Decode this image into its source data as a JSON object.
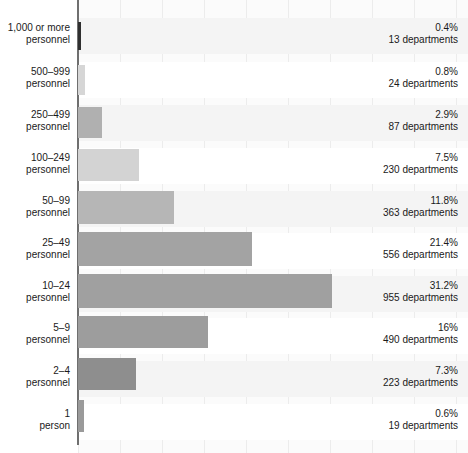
{
  "chart_data": {
    "type": "bar",
    "orientation": "horizontal",
    "title": "",
    "subtitle": "",
    "xlabel": "",
    "ylabel": "",
    "grid": true,
    "legend": "none",
    "xlim": [
      0,
      46.7
    ],
    "value_unit": "percent",
    "count_unit": "departments",
    "categories": [
      "1,000 or more\npersonnel",
      "500–999\npersonnel",
      "250–499\npersonnel",
      "100–249\npersonnel",
      "50–99\npersonnel",
      "25–49\npersonnel",
      "10–24\npersonnel",
      "5–9\npersonnel",
      "2–4\npersonnel",
      "1\nperson"
    ],
    "values": [
      0.4,
      0.8,
      2.9,
      7.5,
      11.8,
      21.4,
      31.2,
      16,
      7.3,
      0.6
    ],
    "counts": [
      13,
      24,
      87,
      230,
      363,
      556,
      955,
      490,
      223,
      19
    ],
    "rows": [
      {
        "category": "1,000 or more\npersonnel",
        "percent_label": "0.4%",
        "count_label": "13 departments",
        "value": 0.4,
        "count": 13,
        "bar_color": "#2f2f2f",
        "bar_width_px": 3,
        "top": 18,
        "height": 36,
        "bar_top": 22,
        "bar_height": 28
      },
      {
        "category": "500–999\npersonnel",
        "percent_label": "0.8%",
        "count_label": "24 departments",
        "value": 0.8,
        "count": 24,
        "bar_color": "#d6d6d6",
        "bar_width_px": 7,
        "top": 62,
        "height": 36,
        "bar_top": 65,
        "bar_height": 30
      },
      {
        "category": "250–499\npersonnel",
        "percent_label": "2.9%",
        "count_label": "87 departments",
        "value": 2.9,
        "count": 87,
        "bar_color": "#b0b0b0",
        "bar_width_px": 24,
        "top": 105,
        "height": 36,
        "bar_top": 107,
        "bar_height": 31
      },
      {
        "category": "100–249\npersonnel",
        "percent_label": "7.5%",
        "count_label": "230 departments",
        "value": 7.5,
        "count": 230,
        "bar_color": "#d3d3d3",
        "bar_width_px": 61,
        "top": 148,
        "height": 36,
        "bar_top": 149,
        "bar_height": 32
      },
      {
        "category": "50–99\npersonnel",
        "percent_label": "11.8%",
        "count_label": "363 departments",
        "value": 11.8,
        "count": 363,
        "bar_color": "#b6b6b6",
        "bar_width_px": 96,
        "top": 191,
        "height": 36,
        "bar_top": 191,
        "bar_height": 33
      },
      {
        "category": "25–49\npersonnel",
        "percent_label": "21.4%",
        "count_label": "556 departments",
        "value": 21.4,
        "count": 556,
        "bar_color": "#a3a3a3",
        "bar_width_px": 174,
        "top": 233,
        "height": 36,
        "bar_top": 232,
        "bar_height": 34
      },
      {
        "category": "10–24\npersonnel",
        "percent_label": "31.2%",
        "count_label": "955 departments",
        "value": 31.2,
        "count": 955,
        "bar_color": "#a0a0a0",
        "bar_width_px": 254,
        "top": 276,
        "height": 36,
        "bar_top": 274,
        "bar_height": 34
      },
      {
        "category": "5–9\npersonnel",
        "percent_label": "16%",
        "count_label": "490 departments",
        "value": 16,
        "count": 490,
        "bar_color": "#9d9d9d",
        "bar_width_px": 130,
        "top": 318,
        "height": 36,
        "bar_top": 316,
        "bar_height": 32
      },
      {
        "category": "2–4\npersonnel",
        "percent_label": "7.3%",
        "count_label": "223 departments",
        "value": 7.3,
        "count": 223,
        "bar_color": "#8e8e8e",
        "bar_width_px": 58,
        "top": 361,
        "height": 36,
        "bar_top": 358,
        "bar_height": 32
      },
      {
        "category": "1\nperson",
        "percent_label": "0.6%",
        "count_label": "19 departments",
        "value": 0.6,
        "count": 19,
        "bar_color": "#9a9a9a",
        "bar_width_px": 6,
        "top": 404,
        "height": 36,
        "bar_top": 400,
        "bar_height": 32
      }
    ],
    "gridlines_px": [
      78,
      120,
      162,
      204,
      246,
      288,
      330,
      372,
      414,
      456
    ],
    "axis_color": "#6f6f6f",
    "grid_color": "#ececec",
    "plot_bg": "#fbfbfb",
    "band_color": "#f4f4f4"
  }
}
